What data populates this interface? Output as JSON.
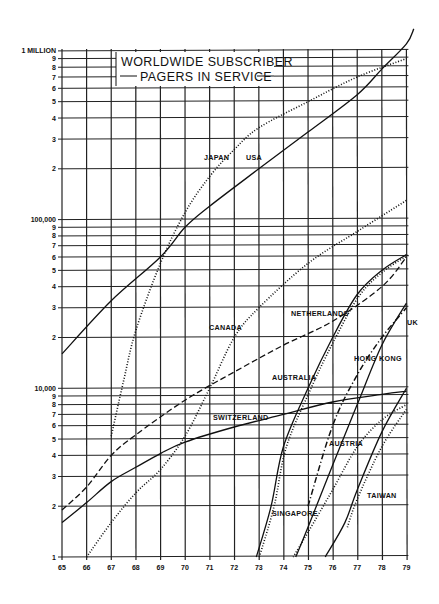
{
  "chart_data": {
    "type": "line",
    "title": "WORLDWIDE SUBSCRIBER PAGERS IN SERVICE",
    "title_lines": [
      "WORLDWIDE SUBSCRIBER",
      "PAGERS IN SERVICE"
    ],
    "xlabel": "",
    "ylabel": "",
    "yscale": "log",
    "ylim": [
      1000,
      1000000
    ],
    "xlim": [
      1965,
      1979
    ],
    "grid": true,
    "legend_position": "inline labels",
    "x_ticks": [
      "65",
      "66",
      "67",
      "68",
      "69",
      "70",
      "71",
      "72",
      "73",
      "74",
      "75",
      "76",
      "77",
      "78",
      "79"
    ],
    "y_ticks": [
      {
        "value": 1000,
        "label": "1"
      },
      {
        "value": 2000,
        "label": "2"
      },
      {
        "value": 3000,
        "label": "3"
      },
      {
        "value": 4000,
        "label": "4"
      },
      {
        "value": 5000,
        "label": "5"
      },
      {
        "value": 6000,
        "label": "6"
      },
      {
        "value": 7000,
        "label": "7"
      },
      {
        "value": 8000,
        "label": "8"
      },
      {
        "value": 9000,
        "label": "9"
      },
      {
        "value": 10000,
        "label": "10,000"
      },
      {
        "value": 20000,
        "label": "2"
      },
      {
        "value": 30000,
        "label": "3"
      },
      {
        "value": 40000,
        "label": "4"
      },
      {
        "value": 50000,
        "label": "5"
      },
      {
        "value": 60000,
        "label": "6"
      },
      {
        "value": 70000,
        "label": "7"
      },
      {
        "value": 80000,
        "label": "8"
      },
      {
        "value": 90000,
        "label": "9"
      },
      {
        "value": 100000,
        "label": "100,000"
      },
      {
        "value": 200000,
        "label": "2"
      },
      {
        "value": 300000,
        "label": "3"
      },
      {
        "value": 400000,
        "label": "4"
      },
      {
        "value": 500000,
        "label": "5"
      },
      {
        "value": 600000,
        "label": "6"
      },
      {
        "value": 700000,
        "label": "7"
      },
      {
        "value": 800000,
        "label": "8"
      },
      {
        "value": 900000,
        "label": "9"
      },
      {
        "value": 1000000,
        "label": "1 MILLION"
      }
    ],
    "series": [
      {
        "name": "USA",
        "style": "solid",
        "x": [
          1965,
          1967,
          1969,
          1970,
          1971,
          1973,
          1975,
          1977,
          1978,
          1979,
          1979.3
        ],
        "values": [
          16000,
          33000,
          60000,
          90000,
          120000,
          200000,
          330000,
          550000,
          780000,
          1100000,
          1350000
        ],
        "label_pos": [
          246,
          160
        ]
      },
      {
        "name": "JAPAN",
        "style": "dotted",
        "x": [
          1967,
          1967.5,
          1968,
          1969,
          1970,
          1971,
          1972,
          1973,
          1975,
          1977,
          1979
        ],
        "values": [
          5200,
          11000,
          22000,
          55000,
          110000,
          180000,
          260000,
          350000,
          500000,
          700000,
          900000
        ],
        "label_pos": [
          204,
          160
        ]
      },
      {
        "name": "CANADA",
        "style": "dotted",
        "x": [
          1966,
          1967,
          1968,
          1969,
          1970,
          1971,
          1972,
          1973,
          1975,
          1977,
          1979
        ],
        "values": [
          1000,
          1600,
          2400,
          3300,
          5200,
          10000,
          20000,
          30000,
          55000,
          85000,
          130000
        ],
        "label_pos": [
          209,
          330
        ]
      },
      {
        "name": "NETHERLANDS",
        "style": "dashed",
        "x": [
          1965,
          1966,
          1967,
          1968,
          1970,
          1972,
          1974,
          1976,
          1978,
          1979
        ],
        "values": [
          1900,
          2600,
          4000,
          5300,
          8500,
          12500,
          18000,
          25000,
          40000,
          60000
        ],
        "label_pos": [
          291,
          316
        ]
      },
      {
        "name": "SWITZERLAND",
        "style": "solid",
        "x": [
          1965,
          1966,
          1967,
          1968,
          1969,
          1970,
          1972,
          1974,
          1976,
          1978,
          1979
        ],
        "values": [
          1600,
          2100,
          2800,
          3400,
          4100,
          4800,
          5900,
          7000,
          8300,
          9200,
          9600
        ],
        "label_pos": [
          213,
          420
        ]
      },
      {
        "name": "AUSTRALIA",
        "style": "solid+dotted",
        "x": [
          1972.9,
          1973.5,
          1974,
          1975,
          1976,
          1977,
          1978,
          1979
        ],
        "values": [
          1000,
          2000,
          4500,
          10000,
          20000,
          36000,
          50000,
          62000
        ],
        "label_pos": [
          272,
          380
        ]
      },
      {
        "name": "HONG KONG",
        "style": "solid",
        "x": [
          1974.5,
          1975,
          1976,
          1977,
          1978,
          1979
        ],
        "values": [
          1000,
          1500,
          3500,
          8000,
          18000,
          32000
        ],
        "label_pos": [
          354,
          361
        ]
      },
      {
        "name": "UK",
        "style": "dash-dot",
        "x": [
          1975,
          1976,
          1977,
          1978,
          1979
        ],
        "values": [
          2000,
          6000,
          12000,
          20000,
          30000
        ],
        "label_pos": [
          407,
          325
        ]
      },
      {
        "name": "SINGAPORE",
        "style": "dotted",
        "x": [
          1974.4,
          1975,
          1976,
          1977,
          1978,
          1979
        ],
        "values": [
          1000,
          1400,
          2500,
          4500,
          6500,
          8000
        ],
        "label_pos": [
          272,
          516
        ]
      },
      {
        "name": "AUSTRIA",
        "style": "solid",
        "x": [
          1975.7,
          1976.5,
          1977,
          1978,
          1979
        ],
        "values": [
          1000,
          1600,
          2500,
          5500,
          10000
        ],
        "label_pos": [
          329,
          446
        ]
      },
      {
        "name": "TAIWAN",
        "style": "dotted",
        "x": [
          1976.6,
          1977,
          1978,
          1979
        ],
        "values": [
          1500,
          2200,
          4500,
          7500
        ],
        "label_pos": [
          367,
          498
        ]
      }
    ]
  }
}
